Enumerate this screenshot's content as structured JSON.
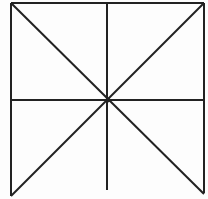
{
  "figure": {
    "background_color": "#fdfdfd",
    "stroke_color": "#222222",
    "stroke_width": 2,
    "viewbox": {
      "width": 208,
      "height": 199
    },
    "center_point": {
      "x": 108,
      "y": 100
    },
    "lines": [
      {
        "name": "square-top-border",
        "x1": 11,
        "y1": 3,
        "x2": 204,
        "y2": 3,
        "diagonal": false
      },
      {
        "name": "square-left-border",
        "x1": 11,
        "y1": 3,
        "x2": 11,
        "y2": 196,
        "diagonal": false
      },
      {
        "name": "square-right-border",
        "x1": 204,
        "y1": 3,
        "x2": 204,
        "y2": 193,
        "diagonal": false
      },
      {
        "name": "vertical-midline",
        "x1": 107,
        "y1": 3,
        "x2": 107,
        "y2": 190,
        "diagonal": false
      },
      {
        "name": "horizontal-midline",
        "x1": 11,
        "y1": 100,
        "x2": 204,
        "y2": 100,
        "diagonal": false
      },
      {
        "name": "diagonal-topleft-bottomright",
        "x1": 11,
        "y1": 3,
        "x2": 204,
        "y2": 194,
        "diagonal": true
      },
      {
        "name": "diagonal-bottomleft-topright",
        "x1": 11,
        "y1": 196,
        "x2": 204,
        "y2": 3,
        "diagonal": true
      }
    ]
  }
}
